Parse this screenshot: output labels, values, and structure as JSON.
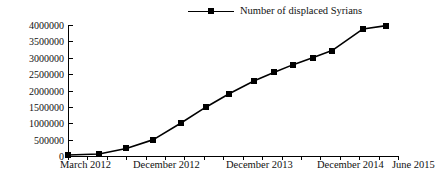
{
  "chart_data": {
    "type": "line",
    "title": "",
    "xlabel": "",
    "ylabel": "",
    "legend": [
      {
        "name": "Number of displaced Syrians",
        "marker": "square",
        "color": "#000000"
      }
    ],
    "legend_position": "top-center",
    "grid": false,
    "ylim": [
      0,
      4000000
    ],
    "ytick_labels": [
      "0",
      "500000",
      "1000000",
      "1500000",
      "2000000",
      "2500000",
      "3000000",
      "3500000",
      "4000000"
    ],
    "ytick_values": [
      0,
      500000,
      1000000,
      1500000,
      2000000,
      2500000,
      3000000,
      3500000,
      4000000
    ],
    "xtick_labels": [
      "March 2012",
      "December 2012",
      "December 2013",
      "December 2014",
      "June 2015"
    ],
    "xtick_label_positions": [
      0,
      3,
      9,
      15,
      17
    ],
    "x_index": [
      0,
      1,
      2,
      3,
      4,
      5,
      6,
      7,
      8,
      9,
      10,
      11,
      12,
      13,
      14,
      15,
      16,
      17
    ],
    "series": [
      {
        "name": "Number of displaced Syrians",
        "values": [
          30000,
          60000,
          230000,
          500000,
          1000000,
          1490000,
          1900000,
          2300000,
          2550000,
          2790000,
          3000000,
          3220000,
          3880000,
          3980000
        ],
        "point_x_index": [
          0,
          1.6,
          3.0,
          4.4,
          5.8,
          7.1,
          8.3,
          9.6,
          10.6,
          11.6,
          12.6,
          13.6,
          15.2,
          16.4
        ]
      }
    ]
  },
  "legend": {
    "label": "Number of displaced Syrians"
  },
  "axes": {
    "x_labels": [
      {
        "text": "March 2012",
        "left_px": 60
      },
      {
        "text": "December 2012",
        "left_px": 133
      },
      {
        "text": "December 2013",
        "left_px": 226
      },
      {
        "text": "December 2014",
        "left_px": 317
      },
      {
        "text": "June 2015",
        "left_px": 392
      }
    ]
  },
  "colors": {
    "series": "#000000",
    "axis": "#000000",
    "background": "#ffffff"
  }
}
